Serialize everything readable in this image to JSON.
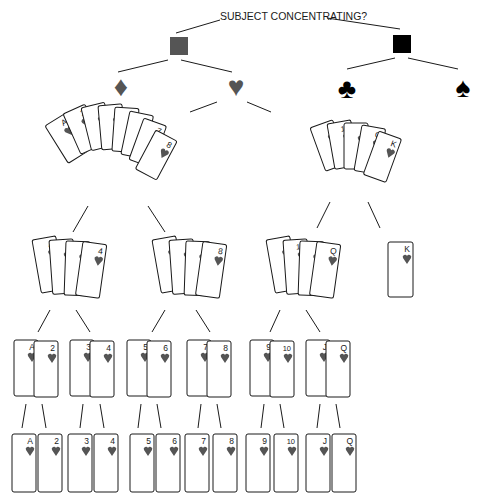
{
  "title": "SUBJECT CONCENTRATING?",
  "colors": {
    "ink": "#1a1a1a",
    "red_suit_gray": "#555555",
    "black_suit": "#000000",
    "card_fill": "#ffffff"
  },
  "level1": [
    {
      "name": "red-color-node",
      "shape": "square",
      "color": "#555555"
    },
    {
      "name": "black-color-node",
      "shape": "square",
      "color": "#000000"
    }
  ],
  "level2": [
    {
      "name": "diamond-suit-node",
      "glyph": "♦",
      "icon": "diamond-icon",
      "color": "#555555"
    },
    {
      "name": "heart-suit-node",
      "glyph": "♥",
      "icon": "heart-icon",
      "color": "#555555"
    },
    {
      "name": "club-suit-node",
      "glyph": "♣",
      "icon": "club-icon",
      "color": "#000000"
    },
    {
      "name": "spade-suit-node",
      "glyph": "♠",
      "icon": "spade-icon",
      "color": "#000000"
    }
  ],
  "level3": [
    {
      "name": "hearts-low-fan",
      "cards": [
        "A",
        "2",
        "3",
        "4",
        "5",
        "6",
        "7",
        "8"
      ]
    },
    {
      "name": "hearts-high-fan",
      "cards": [
        "9",
        "10",
        "J",
        "Q",
        "K"
      ]
    }
  ],
  "level4": [
    {
      "name": "group-a-4",
      "cards": [
        "A",
        "2",
        "3",
        "4"
      ]
    },
    {
      "name": "group-5-8",
      "cards": [
        "5",
        "6",
        "7",
        "8"
      ]
    },
    {
      "name": "group-9-q",
      "cards": [
        "9",
        "10",
        "J",
        "Q"
      ]
    },
    {
      "name": "group-k",
      "cards": [
        "K"
      ]
    }
  ],
  "level5": [
    {
      "cards": [
        "A",
        "2"
      ]
    },
    {
      "cards": [
        "3",
        "4"
      ]
    },
    {
      "cards": [
        "5",
        "6"
      ]
    },
    {
      "cards": [
        "7",
        "8"
      ]
    },
    {
      "cards": [
        "9",
        "10"
      ]
    },
    {
      "cards": [
        "J",
        "Q"
      ]
    }
  ],
  "level6": [
    "A",
    "2",
    "3",
    "4",
    "5",
    "6",
    "7",
    "8",
    "9",
    "10",
    "J",
    "Q"
  ]
}
